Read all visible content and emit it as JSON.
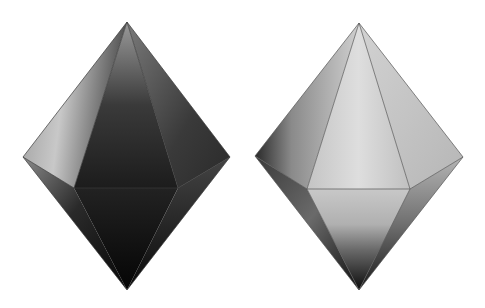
{
  "figure": {
    "shapes": [
      {
        "name": "dark-bipyramid",
        "shading": "dark",
        "colors": {
          "highlight": "#bdbdbd",
          "mid": "#4a4a4a",
          "shadow": "#0a0a0a"
        }
      },
      {
        "name": "light-bipyramid",
        "shading": "light",
        "colors": {
          "highlight": "#e6e6e6",
          "mid": "#a8a8a8",
          "shadow": "#101010"
        }
      }
    ]
  }
}
